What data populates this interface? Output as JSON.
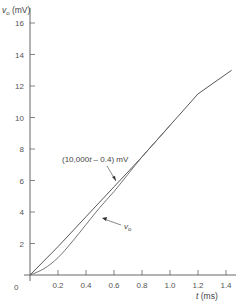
{
  "chart_data": {
    "type": "line",
    "title": "",
    "xlabel": "t (ms)",
    "ylabel": "vo (mV)",
    "xlim": [
      0,
      1.4
    ],
    "ylim": [
      0,
      16
    ],
    "x_ticks": [
      "0.2",
      "0.4",
      "0.6",
      "0.8",
      "1.0",
      "1.2",
      "1.4"
    ],
    "y_ticks": [
      "2",
      "4",
      "6",
      "8",
      "10",
      "12",
      "14",
      "16"
    ],
    "origin_label": "0",
    "grid": false,
    "series": [
      {
        "name": "(10,000t - 0.4) mV",
        "x": [
          0,
          0.2,
          0.4,
          0.6,
          0.8,
          1.0,
          1.2,
          1.44
        ],
        "y": [
          0,
          1.8,
          3.7,
          5.6,
          7.5,
          9.5,
          11.5,
          13.0
        ]
      },
      {
        "name": "vo",
        "x": [
          0,
          0.1,
          0.2,
          0.3,
          0.4,
          0.5,
          0.6,
          0.7,
          0.8,
          0.9,
          1.0
        ],
        "y": [
          0,
          0.4,
          1.1,
          2.1,
          3.2,
          4.3,
          5.3,
          6.4,
          7.5,
          8.5,
          9.5
        ]
      }
    ],
    "annotations": [
      {
        "text": "(10,000t - 0.4) mV",
        "points_to": "asymptote line near t=0.7 ms"
      },
      {
        "text": "vo",
        "points_to": "vo curve near t=0.6 ms"
      }
    ]
  }
}
